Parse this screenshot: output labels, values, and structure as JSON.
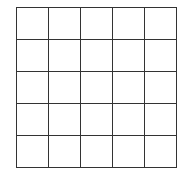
{
  "board": {
    "rows": 5,
    "cols": 5,
    "cells": [
      [
        "",
        "",
        "",
        "",
        ""
      ],
      [
        "",
        "",
        "",
        "",
        ""
      ],
      [
        "",
        "",
        "",
        "",
        ""
      ],
      [
        "",
        "",
        "",
        "",
        ""
      ],
      [
        "",
        "",
        "",
        "",
        ""
      ]
    ],
    "line_color": "#333333",
    "background": "#ffffff"
  }
}
